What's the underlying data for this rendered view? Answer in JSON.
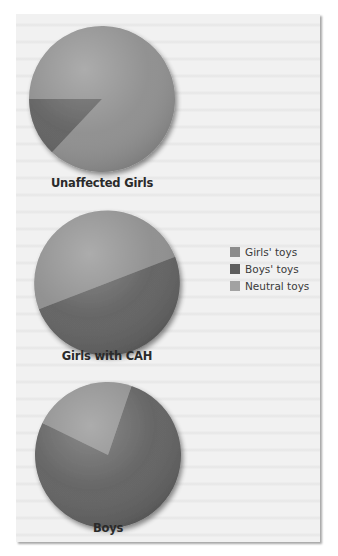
{
  "chart_data": {
    "type": "pie",
    "title": "",
    "legend": {
      "position": "right",
      "entries": [
        {
          "label": "Girls' toys",
          "color": "#8c8c8c"
        },
        {
          "label": "Boys' toys",
          "color": "#5e5e5e"
        },
        {
          "label": "Neutral toys",
          "color": "#a2a2a2"
        }
      ]
    },
    "pies": [
      {
        "label": "Unaffected Girls",
        "slices": [
          {
            "category": "Girls' toys",
            "value": 87
          },
          {
            "category": "Boys' toys",
            "value": 13
          },
          {
            "category": "Neutral toys",
            "value": 0
          }
        ]
      },
      {
        "label": "Girls with CAH",
        "slices": [
          {
            "category": "Girls' toys",
            "value": 50
          },
          {
            "category": "Boys' toys",
            "value": 50
          },
          {
            "category": "Neutral toys",
            "value": 0
          }
        ]
      },
      {
        "label": "Boys",
        "slices": [
          {
            "category": "Girls' toys",
            "value": 23
          },
          {
            "category": "Boys' toys",
            "value": 77
          },
          {
            "category": "Neutral toys",
            "value": 0
          }
        ]
      }
    ],
    "units": "percent of play time (estimated from slice angles)"
  },
  "labels": {
    "pie1": "Unaffected Girls",
    "pie2": "Girls with CAH",
    "pie3": "Boys"
  },
  "legend": {
    "girls": "Girls' toys",
    "boys": "Boys' toys",
    "neutral": "Neutral toys"
  }
}
